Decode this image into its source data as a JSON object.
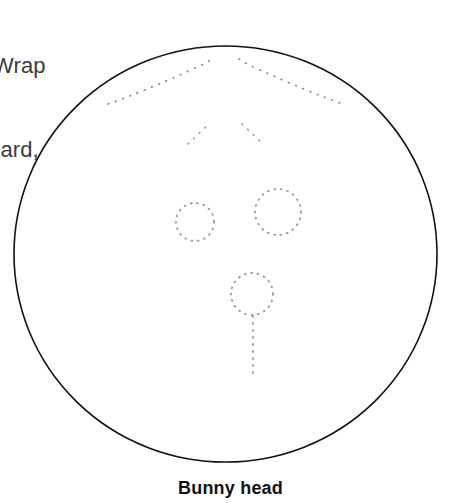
{
  "page": {
    "width": 461,
    "height": 503,
    "background": "#ffffff"
  },
  "instructions": {
    "clipped": true,
    "line1": "on. Wrap",
    "line2": "rdboard,",
    "color": "#3b3b3d"
  },
  "figure": {
    "name": "bunny-head-template",
    "outline_color": "#111114",
    "dotted_color": "#8c8c96",
    "head": {
      "shape": "circle",
      "cx": 225.5,
      "cy": 254,
      "rx": 211.5,
      "ry": 208,
      "stroke_width": 1.6
    },
    "ears": [
      {
        "label": "left-ear-fold",
        "path": "M 108 104 C 131 96 163 83 195 68 C 202 65 208 62 212 59"
      },
      {
        "label": "right-ear-fold",
        "path": "M 239 59 C 243 62 249 65 256 68 C 288 83 320 96 343 104"
      }
    ],
    "brow_marks": [
      {
        "label": "left-brow-mark",
        "path": "M 188 144 L 209 124"
      },
      {
        "label": "right-brow-mark",
        "path": "M 242 124 L 263 144"
      }
    ],
    "eyes": [
      {
        "label": "left-eye",
        "cx": 195,
        "cy": 222,
        "r": 19
      },
      {
        "label": "right-eye",
        "cx": 278,
        "cy": 212,
        "r": 23
      }
    ],
    "nose": {
      "label": "nose",
      "cx": 252,
      "cy": 294,
      "r": 21
    },
    "mouth": {
      "label": "mouth-line",
      "x": 253,
      "y1": 316,
      "y2": 376
    }
  },
  "caption": {
    "text": "Bunny head"
  }
}
